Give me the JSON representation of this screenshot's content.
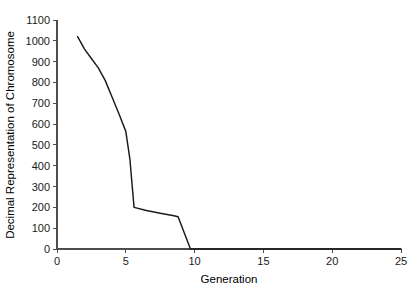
{
  "chart_data": {
    "type": "line",
    "title": "",
    "xlabel": "Generation",
    "ylabel": "Decimal Representation of Chromosome",
    "xlim": [
      0,
      25
    ],
    "ylim": [
      0,
      1100
    ],
    "xticks": [
      0,
      5,
      10,
      15,
      20,
      25
    ],
    "yticks": [
      0,
      100,
      200,
      300,
      400,
      500,
      600,
      700,
      800,
      900,
      1000,
      1100
    ],
    "xtick_labels": [
      "0",
      "5",
      "10",
      "15",
      "20",
      "25"
    ],
    "ytick_labels": [
      "0",
      "100",
      "200",
      "300",
      "400",
      "500",
      "600",
      "700",
      "800",
      "900",
      "1000",
      "1100"
    ],
    "grid": false,
    "legend": false,
    "legend_position": "none",
    "line_color": "#1a1a1a",
    "axis_color": "#4d4d4d",
    "background_color": "#ffffff",
    "series": [
      {
        "name": "Decimal Representation of Chromosome",
        "x": [
          1.5,
          2.0,
          2.5,
          3.0,
          3.5,
          4.0,
          4.5,
          5.0,
          5.3,
          5.6,
          6.5,
          7.5,
          8.5,
          8.8,
          9.7,
          12.0,
          15.0,
          20.0,
          25.0
        ],
        "values": [
          1020,
          960,
          915,
          870,
          810,
          730,
          650,
          565,
          430,
          200,
          185,
          172,
          160,
          155,
          0,
          0,
          0,
          0,
          0
        ]
      }
    ]
  }
}
